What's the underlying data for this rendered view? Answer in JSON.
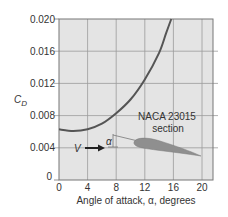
{
  "chart_data": {
    "type": "line",
    "title": "",
    "xlabel": "Angle of attack, α, degrees",
    "ylabel": "C_D",
    "ylabel_main": "C",
    "ylabel_sub": "D",
    "xlim": [
      0,
      21.5
    ],
    "ylim": [
      0,
      0.02
    ],
    "xticks": [
      0,
      4,
      8,
      12,
      16,
      20
    ],
    "yticks": [
      0,
      0.004,
      0.008,
      0.012,
      0.016,
      0.02
    ],
    "xtick_labels": [
      "0",
      "4",
      "8",
      "12",
      "16",
      "20"
    ],
    "ytick_labels": [
      "0",
      "0.004",
      "0.008",
      "0.012",
      "0.016",
      "0.020"
    ],
    "grid": true,
    "series": [
      {
        "name": "NACA 23015 section drag coefficient",
        "x": [
          0,
          2,
          4,
          6,
          8,
          10,
          12,
          14,
          15,
          15.7
        ],
        "y": [
          0.0063,
          0.0061,
          0.0063,
          0.007,
          0.0083,
          0.01,
          0.0125,
          0.0158,
          0.0183,
          0.02
        ]
      }
    ],
    "annotations": [
      {
        "text": "NACA 23015",
        "role": "airfoil-label-line1"
      },
      {
        "text": "section",
        "role": "airfoil-label-line2"
      },
      {
        "text": "V",
        "role": "freestream-velocity"
      },
      {
        "text": "α",
        "role": "angle-of-attack-symbol"
      }
    ],
    "colors": {
      "plot_bg": "#e4e4e4",
      "grid": "#9b9b9b",
      "axis": "#777777",
      "curve": "#555555",
      "airfoil": "#8f8f8f",
      "arrow": "#222222"
    }
  }
}
